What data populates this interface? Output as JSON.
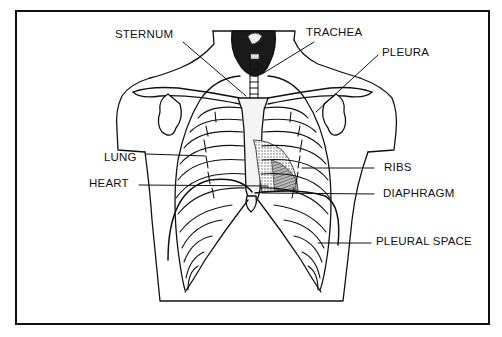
{
  "figure": {
    "type": "anatomical-diagram",
    "colors": {
      "ink": "#111111",
      "background": "#ffffff",
      "shading": "#777777"
    }
  },
  "labels": {
    "sternum": "STERNUM",
    "trachea": "TRACHEA",
    "pleura": "PLEURA",
    "lung": "LUNG",
    "heart": "HEART",
    "ribs": "RIBS",
    "diaphragm": "DIAPHRAGM",
    "pleural_space": "PLEURAL SPACE"
  }
}
